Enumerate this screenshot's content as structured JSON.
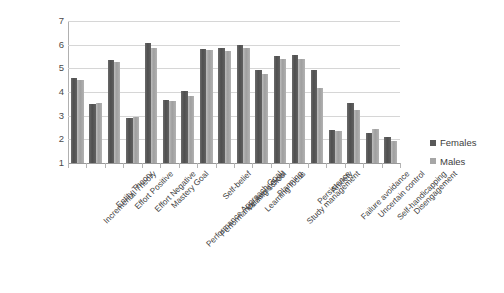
{
  "chart_data": {
    "type": "bar",
    "title": "",
    "subtitle": "",
    "xlabel": "",
    "ylabel": "",
    "ylim": [
      1,
      7
    ],
    "yticks": [
      1,
      2,
      3,
      4,
      5,
      6,
      7
    ],
    "grid": true,
    "legend_position": "right",
    "categories": [
      "Incremental Theory",
      "Entity Theory",
      "Effort Positive",
      "Effort Negative",
      "Mastery Goal",
      "Performance Approach Goal",
      "Performance Avoid Goal",
      "Self-belief",
      "Valuing school",
      "Learning focus",
      "Planning",
      "Study management",
      "Persistence",
      "Anxiety",
      "Failure avoidance",
      "Uncertain control",
      "Self-handicapping",
      "Disengagement"
    ],
    "series": [
      {
        "name": "Females",
        "color": "#595959",
        "values": [
          4.6,
          3.5,
          5.35,
          2.9,
          6.05,
          3.65,
          4.05,
          5.82,
          5.88,
          6.0,
          4.95,
          5.52,
          5.55,
          4.95,
          2.38,
          3.55,
          2.25,
          2.1
        ]
      },
      {
        "name": "Males",
        "color": "#a6a6a6",
        "values": [
          4.5,
          3.55,
          5.28,
          2.95,
          5.85,
          3.6,
          3.85,
          5.78,
          5.75,
          5.85,
          4.78,
          5.4,
          5.4,
          4.15,
          2.35,
          3.25,
          2.42,
          1.95
        ]
      }
    ]
  },
  "legend": {
    "items": [
      {
        "label": "Females"
      },
      {
        "label": "Males"
      }
    ]
  }
}
